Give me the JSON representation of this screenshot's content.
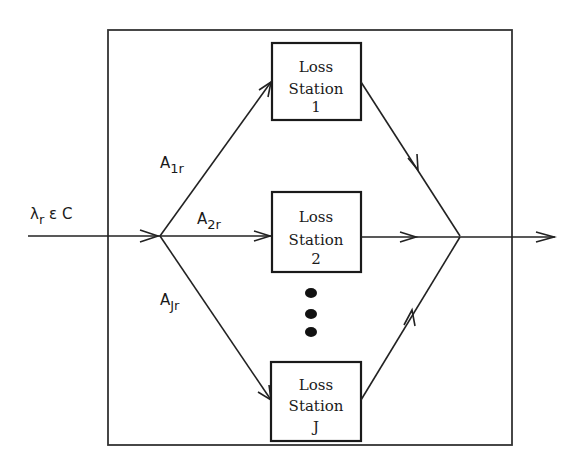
{
  "diagram": {
    "type": "queueing-network",
    "input": {
      "label_symbol": "λ",
      "label_sub": "r",
      "label_rest": " ε C"
    },
    "routes": [
      {
        "label": "A",
        "sub": "1r"
      },
      {
        "label": "A",
        "sub": "2r"
      },
      {
        "label": "A",
        "sub": "Jr"
      }
    ],
    "stations": [
      {
        "line1": "Loss",
        "line2": "Station",
        "line3": "1"
      },
      {
        "line1": "Loss",
        "line2": "Station",
        "line3": "2"
      },
      {
        "line1": "Loss",
        "line2": "Station",
        "line3": "J"
      }
    ],
    "ellipsis": "•••",
    "colors": {
      "stroke": "#222222",
      "background": "#ffffff"
    }
  }
}
